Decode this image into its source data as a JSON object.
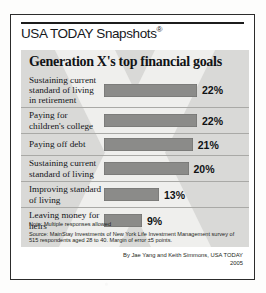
{
  "masthead": {
    "title": "USA TODAY Snapshots",
    "registered_mark": "®"
  },
  "chart_data": {
    "type": "bar",
    "title": "Generation X's top financial goals",
    "orientation": "horizontal",
    "categories": [
      "Sustaining current standard of living in retirement",
      "Paying for children's college",
      "Paying off debt",
      "Sustaining current standard of living",
      "Improving standard of living",
      "Leaving money for heirs"
    ],
    "values": [
      22,
      22,
      21,
      20,
      13,
      9
    ],
    "value_labels": [
      "22%",
      "22%",
      "21%",
      "20%",
      "13%",
      "9%"
    ],
    "xlabel": "",
    "ylabel": "",
    "xlim": [
      0,
      22
    ],
    "unit": "percent",
    "grid": false,
    "legend": false,
    "bar_color": "#8b8b89",
    "panel_color": "#d9d9d7",
    "note": "Note: Multiple responses allowed",
    "source": "Source: MainStay Investments of New York Life Investment Management survey of 515 respondents aged 28 to 40. Margin of error ±5 points."
  },
  "byline": {
    "credit": "By Jae Yang and Keith Simmons, USA TODAY",
    "year": "2005"
  }
}
